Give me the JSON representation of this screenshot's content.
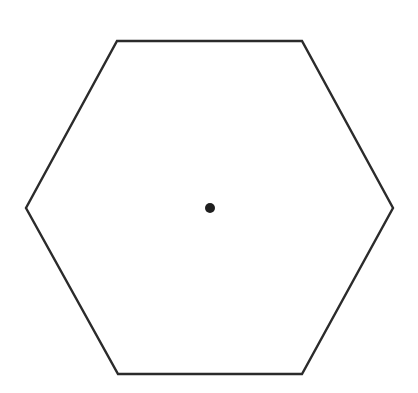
{
  "diagram": {
    "background": "#ffffff",
    "hexagon": {
      "points": [
        [
          117,
          41
        ],
        [
          302,
          41
        ],
        [
          393,
          208
        ],
        [
          302,
          374
        ],
        [
          118,
          374
        ],
        [
          26,
          208
        ]
      ],
      "stroke": "#2b2b2b",
      "stroke_width": 2.4,
      "fill": "none"
    },
    "center_point": {
      "cx": 210,
      "cy": 208,
      "r": 5,
      "fill": "#1f1f1f"
    }
  }
}
